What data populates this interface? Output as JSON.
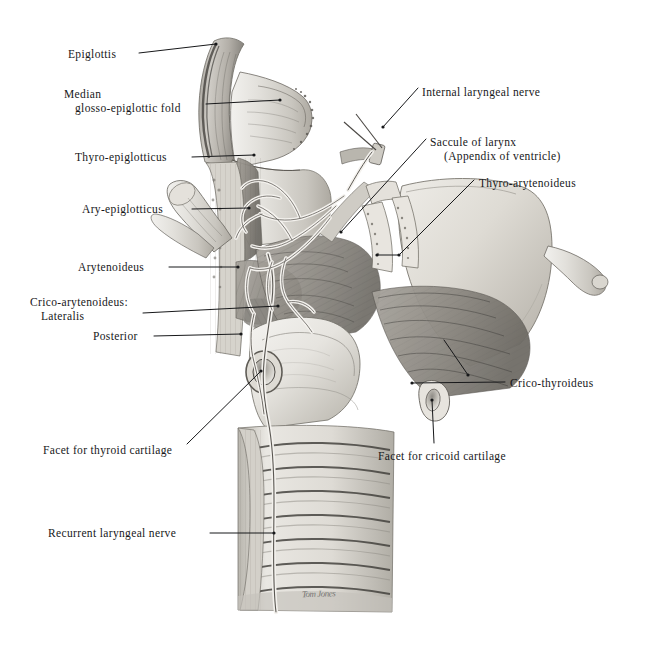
{
  "plate": {
    "title": "Muscles and nerves of the larynx — lateral view",
    "background_color": "#ffffff",
    "ink_color": "#17181a",
    "signature": "Tom Jones"
  },
  "labels_left": [
    {
      "id": "epiglottis",
      "text": "Epiglottis",
      "x": 68,
      "y": 48,
      "line": {
        "x1": 139,
        "y1": 53,
        "x2": 216,
        "y2": 44
      }
    },
    {
      "id": "median-glosso-epiglottic-fold",
      "text": "Median",
      "text2": "glosso-epiglottic fold",
      "x": 64,
      "y": 88,
      "line": {
        "x1": 206,
        "y1": 104,
        "x2": 280,
        "y2": 100
      }
    },
    {
      "id": "thyro-epiglotticus",
      "text": "Thyro-epiglotticus",
      "x": 75,
      "y": 151,
      "line": {
        "x1": 192,
        "y1": 157,
        "x2": 254,
        "y2": 155
      }
    },
    {
      "id": "ary-epiglotticus",
      "text": "Ary-epiglotticus",
      "x": 82,
      "y": 203,
      "line": {
        "x1": 192,
        "y1": 209,
        "x2": 249,
        "y2": 208
      }
    },
    {
      "id": "arytenoideus",
      "text": "Arytenoideus",
      "x": 78,
      "y": 261,
      "line": {
        "x1": 169,
        "y1": 267,
        "x2": 238,
        "y2": 267
      }
    },
    {
      "id": "crico-arytenoideus",
      "text": "Crico-arytenoideus:",
      "text2": "Lateralis",
      "x": 30,
      "y": 296,
      "line": {
        "x1": 143,
        "y1": 313,
        "x2": 278,
        "y2": 306
      }
    },
    {
      "id": "posterior",
      "text": "Posterior",
      "x": 93,
      "y": 330,
      "line": {
        "x1": 154,
        "y1": 336,
        "x2": 241,
        "y2": 334
      }
    },
    {
      "id": "facet-for-thyroid-cartilage",
      "text": "Facet for thyroid cartilage",
      "x": 43,
      "y": 444,
      "line": {
        "x1": 187,
        "y1": 444,
        "x2": 261,
        "y2": 371
      }
    },
    {
      "id": "recurrent-laryngeal-nerve",
      "text": "Recurrent laryngeal nerve",
      "x": 48,
      "y": 527,
      "line": {
        "x1": 210,
        "y1": 533,
        "x2": 274,
        "y2": 533
      }
    }
  ],
  "labels_right": [
    {
      "id": "internal-laryngeal-nerve",
      "text": "Internal laryngeal nerve",
      "x": 422,
      "y": 86,
      "line": {
        "x1": 418,
        "y1": 88,
        "x2": 383,
        "y2": 127
      }
    },
    {
      "id": "saccule-of-larynx",
      "text": "Saccule of larynx",
      "text2": "(Appendix of ventricle)",
      "x": 430,
      "y": 136,
      "line": {
        "x1": 426,
        "y1": 139,
        "x2": 341,
        "y2": 232
      }
    },
    {
      "id": "thyro-arytenoideus",
      "text": "Thyro-arytenoideus",
      "x": 479,
      "y": 177,
      "line": {
        "x1": 474,
        "y1": 180,
        "x2": 399,
        "y2": 255
      },
      "line2": {
        "x1": 399,
        "y1": 255,
        "x2": 377,
        "y2": 255
      }
    },
    {
      "id": "crico-thyroideus",
      "text": "Crico-thyroideus",
      "x": 510,
      "y": 377,
      "line": {
        "x1": 505,
        "y1": 382,
        "x2": 412,
        "y2": 383
      },
      "line2": {
        "x1": 444,
        "y1": 340,
        "x2": 468,
        "y2": 375
      }
    },
    {
      "id": "facet-for-cricoid-cartilage",
      "text": "Facet for cricoid cartilage",
      "x": 378,
      "y": 450,
      "line": {
        "x1": 434,
        "y1": 443,
        "x2": 432,
        "y2": 400
      }
    }
  ],
  "chart_data": {
    "type": "table",
    "categories": [
      "Epiglottis",
      "Median glosso-epiglottic fold",
      "Thyro-epiglotticus",
      "Ary-epiglotticus",
      "Arytenoideus",
      "Crico-arytenoideus: Lateralis",
      "Crico-arytenoideus: Posterior",
      "Facet for thyroid cartilage",
      "Recurrent laryngeal nerve",
      "Internal laryngeal nerve",
      "Saccule of larynx (Appendix of ventricle)",
      "Thyro-arytenoideus",
      "Crico-thyroideus",
      "Facet for cricoid cartilage"
    ]
  }
}
